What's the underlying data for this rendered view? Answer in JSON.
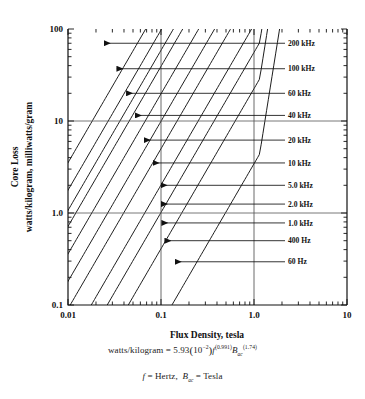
{
  "chart_data": {
    "type": "line",
    "title": "",
    "xlabel": "Flux Density, tesla",
    "ylabel_line1": "Core Loss",
    "ylabel_line2": "watts/kilogram, milliwatts/gram",
    "xscale": "log",
    "yscale": "log",
    "xlim": [
      0.01,
      10
    ],
    "ylim": [
      0.1,
      100
    ],
    "grid": false,
    "xticklabels": [
      "0.01",
      "0.1",
      "1.0",
      "10"
    ],
    "xtickvalues": [
      0.01,
      0.1,
      1.0,
      10
    ],
    "yticklabels": [
      "0.1",
      "1.0",
      "10",
      "100"
    ],
    "ytickvalues": [
      0.1,
      1.0,
      10,
      100
    ],
    "reference_lines": {
      "vertical_x": [
        0.1,
        1.0
      ],
      "horizontal_y": [
        1.0,
        10
      ]
    },
    "equation_exponent_f": 0.991,
    "equation_exponent_B": 1.74,
    "equation_coefficient": 5.93,
    "equation_coefficient_power": -2,
    "legend_position": "right-outside",
    "series": [
      {
        "name": "200 kHz",
        "frequency_hz": 200000,
        "label_y": 70,
        "arrow_tip_x": 0.0245
      },
      {
        "name": "100 kHz",
        "frequency_hz": 100000,
        "label_y": 37,
        "arrow_tip_x": 0.0335
      },
      {
        "name": "60 kHz",
        "frequency_hz": 60000,
        "label_y": 20,
        "arrow_tip_x": 0.0425
      },
      {
        "name": "40 kHz",
        "frequency_hz": 40000,
        "label_y": 11.5,
        "arrow_tip_x": 0.053
      },
      {
        "name": "20 kHz",
        "frequency_hz": 20000,
        "label_y": 6.2,
        "arrow_tip_x": 0.066
      },
      {
        "name": "10 kHz",
        "frequency_hz": 10000,
        "label_y": 3.5,
        "arrow_tip_x": 0.082
      },
      {
        "name": "5.0 kHz",
        "frequency_hz": 5000,
        "label_y": 2.0,
        "arrow_tip_x": 0.1
      },
      {
        "name": "2.0 kHz",
        "frequency_hz": 2000,
        "label_y": 1.25,
        "arrow_tip_x": 0.101
      },
      {
        "name": "1.0 kHz",
        "frequency_hz": 1000,
        "label_y": 0.78,
        "arrow_tip_x": 0.102
      },
      {
        "name": "400 Hz",
        "frequency_hz": 400,
        "label_y": 0.5,
        "arrow_tip_x": 0.11
      },
      {
        "name": "60 Hz",
        "frequency_hz": 60,
        "label_y": 0.295,
        "arrow_tip_x": 0.142
      }
    ],
    "annotations": [
      "watts/kilogram = 5.93(10-2)f(0.991)Bac(1.74)",
      "f = Hertz,  Bac = Tesla"
    ]
  },
  "equation": {
    "lhs": "watts/kilogram",
    "eq": "=",
    "coeff": "5.93",
    "paren_open": "(",
    "ten": "10",
    "ten_exp": "−2",
    "paren_close": ")",
    "f_sym": "f",
    "f_exp": "(0.991)",
    "B_sym": "B",
    "B_sub": "ac",
    "B_exp": "(1.74)"
  },
  "definition": {
    "f_sym": "f",
    "eq1": "= Hertz,",
    "B_sym": "B",
    "B_sub": "ac",
    "eq2": "= Tesla"
  }
}
